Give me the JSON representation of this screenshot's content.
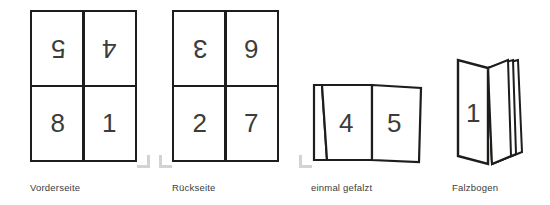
{
  "diagram": {
    "ink_color": "#1d1d1b",
    "digit_color": "#3c3c3b",
    "mark_color": "#d3d3d3",
    "background": "#ffffff"
  },
  "panels": [
    {
      "id": "vorderseite",
      "caption": "Vorderseite",
      "type": "sheet-grid",
      "cells": [
        {
          "position": "top-left",
          "value": "5",
          "rotated": true
        },
        {
          "position": "top-right",
          "value": "4",
          "rotated": true
        },
        {
          "position": "bottom-left",
          "value": "8",
          "rotated": false
        },
        {
          "position": "bottom-right",
          "value": "1",
          "rotated": false
        }
      ]
    },
    {
      "id": "rueckseite",
      "caption": "Rückseite",
      "type": "sheet-grid",
      "cells": [
        {
          "position": "top-left",
          "value": "3",
          "rotated": true
        },
        {
          "position": "top-right",
          "value": "6",
          "rotated": true
        },
        {
          "position": "bottom-left",
          "value": "2",
          "rotated": false
        },
        {
          "position": "bottom-right",
          "value": "7",
          "rotated": false
        }
      ]
    },
    {
      "id": "einmal-gefalzt",
      "caption": "einmal gefalzt",
      "type": "folded-sheet",
      "faces": [
        {
          "position": "left",
          "value": "4"
        },
        {
          "position": "right",
          "value": "5"
        }
      ]
    },
    {
      "id": "falzbogen",
      "caption": "Falzbogen",
      "type": "booklet",
      "cover": {
        "value": "1"
      },
      "visible_page_edges": 3
    }
  ]
}
